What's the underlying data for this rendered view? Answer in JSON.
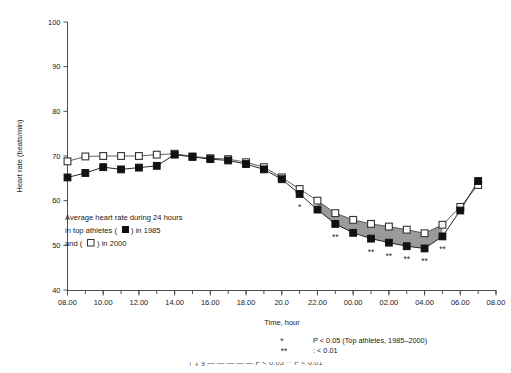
{
  "chart_data": {
    "type": "line",
    "title": "",
    "xlabel": "Time, hour",
    "ylabel": "Heart rate (beats/min)",
    "ylim": [
      40,
      100
    ],
    "yticks": [
      40,
      50,
      60,
      70,
      80,
      90,
      100
    ],
    "xticks": [
      "08.00",
      "10.00",
      "12.00",
      "14.00",
      "16.00",
      "18.00",
      "20.0",
      "22.00",
      "00.00",
      "02.00",
      "04.00",
      "06.00",
      "08.00"
    ],
    "xtick_hours": [
      8,
      10,
      12,
      14,
      16,
      18,
      20,
      22,
      24,
      26,
      28,
      30,
      32
    ],
    "grid": false,
    "legend_position": "inside-left",
    "x": [
      8,
      9,
      10,
      11,
      12,
      13,
      14,
      15,
      16,
      17,
      18,
      19,
      20,
      21,
      22,
      23,
      24,
      25,
      26,
      27,
      28,
      29,
      30,
      31
    ],
    "series": [
      {
        "name": "Top athletes 1985",
        "marker": "filled-square",
        "color": "#111111",
        "values": [
          65.2,
          66.2,
          67.5,
          67.0,
          67.4,
          67.8,
          70.3,
          69.8,
          69.3,
          69.0,
          68.2,
          67.0,
          64.8,
          61.5,
          58.0,
          54.8,
          52.8,
          51.5,
          50.6,
          49.8,
          49.3,
          52.0,
          57.8,
          64.4
        ]
      },
      {
        "name": "Top athletes 2000",
        "marker": "open-square",
        "color": "#ffffff",
        "values": [
          68.8,
          69.9,
          70.0,
          70.0,
          70.0,
          70.3,
          70.5,
          69.9,
          69.5,
          69.3,
          68.6,
          67.5,
          65.2,
          62.6,
          60.0,
          57.2,
          55.7,
          54.8,
          54.2,
          53.5,
          52.7,
          54.6,
          58.6,
          63.5
        ]
      }
    ],
    "shaded_region": {
      "from_hour": 22,
      "to_hour": 29,
      "fill": "#9a9a9a",
      "description": "area between 2000 and 1985 curves during night hours"
    },
    "significance_markers": [
      {
        "hour": 21,
        "symbol": "*"
      },
      {
        "hour": 23,
        "symbol": "**"
      },
      {
        "hour": 25,
        "symbol": "**"
      },
      {
        "hour": 26,
        "symbol": "**"
      },
      {
        "hour": 27,
        "symbol": "**"
      },
      {
        "hour": 28,
        "symbol": "**"
      },
      {
        "hour": 29,
        "symbol": "**"
      }
    ],
    "annotations": [
      "Average heart rate during 24 hours",
      "in top athletes ( ■ ) in 1985",
      "and ( □ ) in 2000"
    ]
  },
  "legend": {
    "line1_pre": "Average heart rate during 24 hours",
    "line2_pre": "in top athletes ( ",
    "line2_post": " ) in 1985",
    "line3_pre": "and ( ",
    "line3_post": " ) in 2000"
  },
  "footnote": {
    "sym1": "*",
    "text1": "P < 0.05 (Top athletes, 1985–2000)",
    "sym2": "**",
    "text2": ": < 0.01"
  },
  "bottom_cut": {
    "text": "† ‡ §  —  — —  — —  P < 0.05  ** P < 0.01"
  },
  "colors": {
    "axis": "#4d4d4d",
    "series1985": "#111111",
    "series2000_edge": "#4d4d4d",
    "shade": "#9a9a9a",
    "text": "#1a1a1a"
  }
}
